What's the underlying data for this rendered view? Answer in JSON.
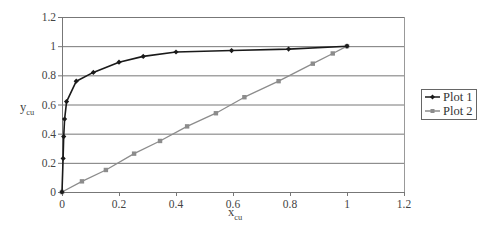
{
  "chart_data": {
    "type": "line",
    "title": "",
    "xlabel": "x_cu",
    "ylabel": "y_cu",
    "xlabel_main": "x",
    "xlabel_sub": "cu",
    "ylabel_main": "y",
    "ylabel_sub": "cu",
    "xlim": [
      0,
      1.2
    ],
    "ylim": [
      0,
      1.2
    ],
    "xticks": [
      0,
      0.2,
      0.4,
      0.6,
      0.8,
      1,
      1.2
    ],
    "xtick_labels": [
      "0",
      "0.2",
      "0.4",
      "0.6",
      "0.8",
      "1",
      "1.2"
    ],
    "yticks": [
      0,
      0.2,
      0.4,
      0.6,
      0.8,
      1,
      1.2
    ],
    "ytick_labels": [
      "0",
      "0.2",
      "0.4",
      "0.6",
      "0.8",
      "1",
      "1.2"
    ],
    "grid": {
      "horizontal": true,
      "vertical": false
    },
    "legend_position": "right",
    "series": [
      {
        "name": "Plot 1",
        "color": "#1a1a1a",
        "marker": "diamond",
        "x": [
          0,
          0.004,
          0.006,
          0.009,
          0.016,
          0.05,
          0.11,
          0.2,
          0.285,
          0.4,
          0.595,
          0.795,
          1.0
        ],
        "y": [
          0,
          0.23,
          0.38,
          0.5,
          0.62,
          0.76,
          0.82,
          0.89,
          0.93,
          0.96,
          0.97,
          0.98,
          1.0
        ]
      },
      {
        "name": "Plot 2",
        "color": "#8c8c8c",
        "marker": "square",
        "x": [
          0,
          0.07,
          0.154,
          0.253,
          0.344,
          0.439,
          0.54,
          0.64,
          0.76,
          0.88,
          0.95,
          1.0
        ],
        "y": [
          0,
          0.073,
          0.151,
          0.263,
          0.35,
          0.45,
          0.54,
          0.65,
          0.76,
          0.88,
          0.95,
          1.0
        ]
      }
    ]
  },
  "legend": {
    "items": [
      {
        "label": "Plot 1"
      },
      {
        "label": "Plot 2"
      }
    ]
  }
}
